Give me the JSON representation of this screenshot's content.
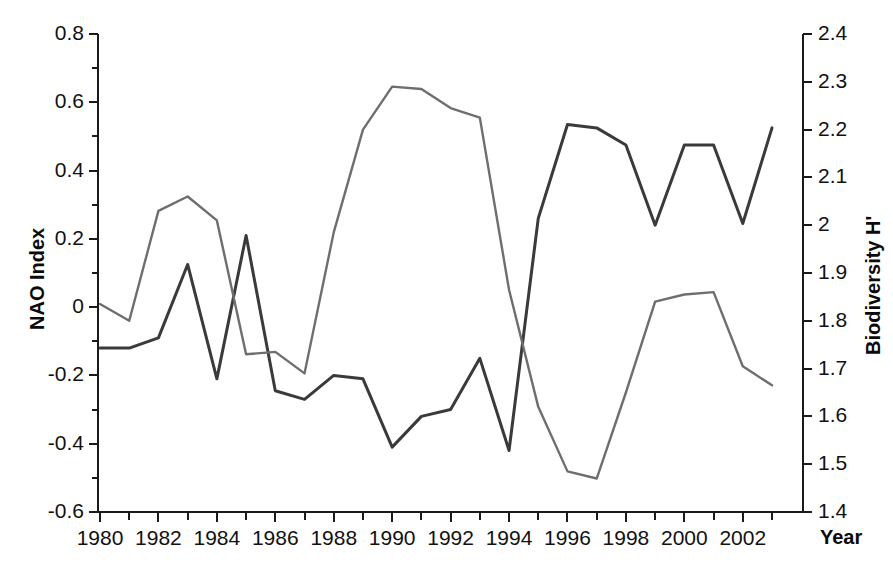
{
  "chart_data": {
    "type": "line",
    "title": "",
    "xlabel": "Year",
    "ylabel": "NAO Index",
    "ylabel_right": "Biodiversity H'",
    "grid": false,
    "legend": "none",
    "x": [
      1980,
      1981,
      1982,
      1983,
      1984,
      1985,
      1986,
      1987,
      1988,
      1989,
      1990,
      1991,
      1992,
      1993,
      1994,
      1995,
      1996,
      1997,
      1998,
      1999,
      2000,
      2001,
      2002,
      2003
    ],
    "xlim": [
      1979.5,
      2003.5
    ],
    "ylim": [
      -0.6,
      0.8
    ],
    "ylim_right": [
      1.4,
      2.4
    ],
    "xticks": [
      "1980",
      "1982",
      "1984",
      "1986",
      "1988",
      "1990",
      "1992",
      "1994",
      "1996",
      "1998",
      "2000",
      "2002"
    ],
    "xtick_values": [
      1980,
      1982,
      1984,
      1986,
      1988,
      1990,
      1992,
      1994,
      1996,
      1998,
      2000,
      2002
    ],
    "yticks_left": [
      "0.8",
      "0.6",
      "0.4",
      "0.2",
      "0",
      "-0.2",
      "-0.4",
      "-0.6"
    ],
    "ytick_values_left": [
      0.8,
      0.6,
      0.4,
      0.2,
      0,
      -0.2,
      -0.4,
      -0.6
    ],
    "yticks_right": [
      "2.4",
      "2.3",
      "2.2",
      "2.1",
      "2",
      "1.9",
      "1.8",
      "1.7",
      "1.6",
      "1.5",
      "1.4"
    ],
    "ytick_values_right": [
      2.4,
      2.3,
      2.2,
      2.1,
      2.0,
      1.9,
      1.8,
      1.7,
      1.6,
      1.5,
      1.4
    ],
    "series": [
      {
        "name": "NAO Index",
        "axis": "left",
        "color": "#3a3a3a",
        "width": 3.0,
        "values": [
          -0.12,
          -0.12,
          -0.09,
          0.125,
          -0.21,
          0.21,
          -0.245,
          -0.27,
          -0.2,
          -0.21,
          -0.41,
          -0.32,
          -0.3,
          -0.15,
          -0.42,
          0.26,
          0.535,
          0.525,
          0.475,
          0.24,
          0.475,
          0.475,
          0.245,
          0.525
        ]
      },
      {
        "name": "Biodiversity H'",
        "axis": "right",
        "color": "#6e6e6e",
        "width": 2.4,
        "values": [
          1.835,
          1.8,
          2.03,
          2.06,
          2.01,
          1.73,
          1.735,
          1.69,
          1.985,
          2.2,
          2.29,
          2.285,
          2.245,
          2.225,
          1.865,
          1.62,
          1.485,
          1.47,
          1.65,
          1.84,
          1.855,
          1.86,
          1.705,
          1.665
        ]
      }
    ],
    "crossover_note": ""
  },
  "axis": {
    "left_title": "NAO Index",
    "right_title": "Biodiversity H'",
    "x_title": "Year"
  }
}
